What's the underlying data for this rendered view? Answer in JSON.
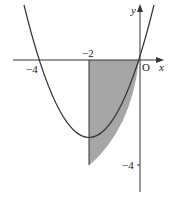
{
  "diagram": {
    "type": "function-graph",
    "curve": {
      "equation": "y = x^2 + 4x",
      "vertex": [
        -2,
        -4
      ],
      "roots": [
        -4,
        0
      ]
    },
    "shaded_region": {
      "x_from": -2,
      "x_to": 0,
      "fill": "#a6a6a6"
    },
    "axes": {
      "x_label": "x",
      "y_label": "y",
      "origin_label": "O"
    },
    "tick_labels": {
      "x_neg4": "−4",
      "x_neg2": "−2",
      "y_neg4": "−4"
    },
    "colors": {
      "line": "#333333",
      "shade": "#a6a6a6",
      "background": "#ffffff"
    }
  }
}
